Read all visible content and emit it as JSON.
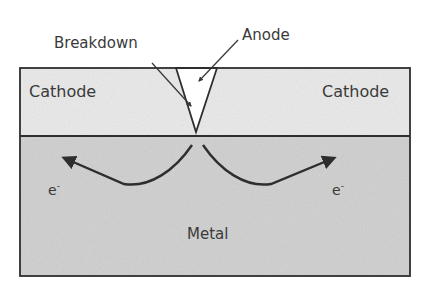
{
  "diagram": {
    "labels": {
      "breakdown": "Breakdown",
      "anode": "Anode",
      "cathode_left": "Cathode",
      "cathode_right": "Cathode",
      "metal": "Metal",
      "electron_left": "e",
      "electron_left_sup": "-",
      "electron_right": "e",
      "electron_right_sup": "-"
    },
    "colors": {
      "cathode_fill": "#e9e9e9",
      "metal_fill": "#cfcfcf",
      "line": "#2e2e2e",
      "text": "#3a3a3a"
    }
  }
}
